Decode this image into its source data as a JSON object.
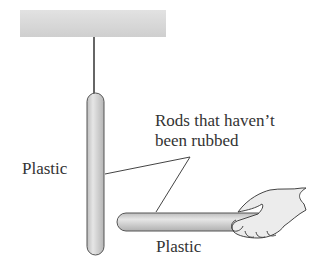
{
  "diagram": {
    "labels": {
      "left_rod": "Plastic",
      "bottom_rod": "Plastic",
      "callout_line1": "Rods that haven’t",
      "callout_line2": "been rubbed"
    },
    "components": [
      "ceiling",
      "string",
      "hanging-rod",
      "held-rod",
      "hand"
    ],
    "colors": {
      "ceiling": "#d6d6d6",
      "rod_fill": "#d2d2d2",
      "rod_outline": "#555555",
      "line": "#444444",
      "text": "#333333"
    }
  }
}
